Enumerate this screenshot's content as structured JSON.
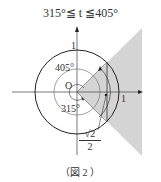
{
  "title": "315°≦ t ≦405°",
  "labels": {
    "unit_y": "1",
    "unit_x": "1",
    "origin": "O",
    "angle_upper": "405°",
    "angle_lower": "315°",
    "x_value_num": "√2",
    "x_value_den": "2"
  },
  "caption": "（図 2 ）",
  "colors": {
    "shade": "#d4d4d4",
    "line": "#333333"
  }
}
